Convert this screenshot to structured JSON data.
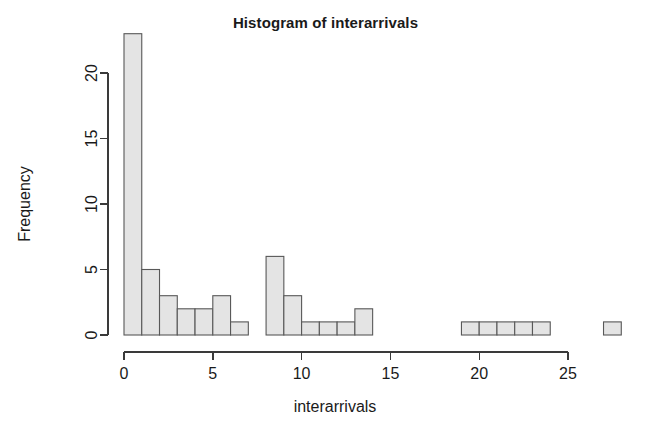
{
  "chart_data": {
    "type": "bar",
    "title": "Histogram of interarrivals",
    "xlabel": "interarrivals",
    "ylabel": "Frequency",
    "grid": false,
    "legend": "none",
    "xlim": [
      0,
      28
    ],
    "ylim": [
      0,
      23
    ],
    "xticks": [
      "0",
      "5",
      "10",
      "15",
      "20",
      "25"
    ],
    "xtick_values": [
      0,
      5,
      10,
      15,
      20,
      25
    ],
    "yticks": [
      "0",
      "5",
      "10",
      "15",
      "20"
    ],
    "ytick_values": [
      0,
      5,
      10,
      15,
      20
    ],
    "bin_width": 1,
    "bin_starts": [
      0,
      1,
      2,
      3,
      4,
      5,
      6,
      8,
      9,
      10,
      11,
      12,
      13,
      19,
      20,
      21,
      22,
      23,
      27
    ],
    "values": [
      23,
      5,
      3,
      2,
      2,
      3,
      1,
      6,
      3,
      1,
      1,
      1,
      2,
      1,
      1,
      1,
      1,
      1,
      1
    ],
    "bars": [
      {
        "x0": 0,
        "x1": 1,
        "y": 23
      },
      {
        "x0": 1,
        "x1": 2,
        "y": 5
      },
      {
        "x0": 2,
        "x1": 3,
        "y": 3
      },
      {
        "x0": 3,
        "x1": 4,
        "y": 2
      },
      {
        "x0": 4,
        "x1": 5,
        "y": 2
      },
      {
        "x0": 5,
        "x1": 6,
        "y": 3
      },
      {
        "x0": 6,
        "x1": 7,
        "y": 1
      },
      {
        "x0": 8,
        "x1": 9,
        "y": 6
      },
      {
        "x0": 9,
        "x1": 10,
        "y": 3
      },
      {
        "x0": 10,
        "x1": 11,
        "y": 1
      },
      {
        "x0": 11,
        "x1": 12,
        "y": 1
      },
      {
        "x0": 12,
        "x1": 13,
        "y": 1
      },
      {
        "x0": 13,
        "x1": 14,
        "y": 2
      },
      {
        "x0": 19,
        "x1": 20,
        "y": 1
      },
      {
        "x0": 20,
        "x1": 21,
        "y": 1
      },
      {
        "x0": 21,
        "x1": 22,
        "y": 1
      },
      {
        "x0": 22,
        "x1": 23,
        "y": 1
      },
      {
        "x0": 23,
        "x1": 24,
        "y": 1
      },
      {
        "x0": 27,
        "x1": 28,
        "y": 1
      }
    ],
    "colors": {
      "bar_fill": "#e4e4e4",
      "bar_stroke": "#585858",
      "axis": "#3a3a3a",
      "text": "#1a1a1a",
      "background": "#ffffff"
    }
  }
}
